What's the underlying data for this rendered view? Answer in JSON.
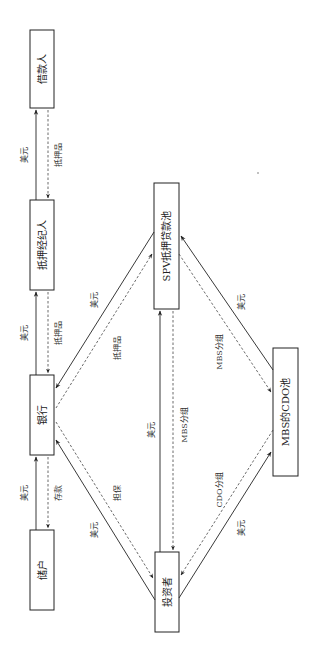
{
  "diagram": {
    "orientation": "rotated-90-ccw",
    "nodes": {
      "borrower": {
        "label": "借款人"
      },
      "broker": {
        "label": "抵押经纪人"
      },
      "bank": {
        "label": "银行"
      },
      "depositor": {
        "label": "储户"
      },
      "spv": {
        "label": "SPV抵押贷款池"
      },
      "cdo": {
        "label": "MBS的CDO池"
      },
      "investor": {
        "label": "投资者"
      }
    },
    "edges": {
      "broker_borrower_usd": {
        "label": "美元",
        "from": "broker",
        "to": "borrower",
        "style": "solid"
      },
      "borrower_broker_collateral": {
        "label": "抵押品",
        "from": "borrower",
        "to": "broker",
        "style": "dashed"
      },
      "bank_broker_usd": {
        "label": "美元",
        "from": "bank",
        "to": "broker",
        "style": "solid"
      },
      "broker_bank_collateral": {
        "label": "抵押品",
        "from": "broker",
        "to": "bank",
        "style": "dashed"
      },
      "depositor_bank_usd": {
        "label": "美元",
        "from": "depositor",
        "to": "bank",
        "style": "solid"
      },
      "bank_depositor_deposit": {
        "label": "存款",
        "from": "bank",
        "to": "depositor",
        "style": "dashed"
      },
      "spv_bank_usd": {
        "label": "美元",
        "from": "spv",
        "to": "bank",
        "style": "solid"
      },
      "bank_spv_collateral": {
        "label": "抵押品",
        "from": "bank",
        "to": "spv",
        "style": "dashed"
      },
      "investor_bank_usd": {
        "label": "美元",
        "from": "investor",
        "to": "bank",
        "style": "solid"
      },
      "bank_investor_guarantee": {
        "label": "担保",
        "from": "bank",
        "to": "investor",
        "style": "dashed"
      },
      "investor_spv_usd": {
        "label": "美元",
        "from": "investor",
        "to": "spv",
        "style": "solid"
      },
      "spv_investor_mbs": {
        "label": "MBS分组",
        "from": "spv",
        "to": "investor",
        "style": "dashed"
      },
      "cdo_spv_usd": {
        "label": "美元",
        "from": "cdo",
        "to": "spv",
        "style": "solid"
      },
      "spv_cdo_mbs": {
        "label": "MBS分组",
        "from": "spv",
        "to": "cdo",
        "style": "dashed"
      },
      "investor_cdo_usd": {
        "label": "美元",
        "from": "investor",
        "to": "cdo",
        "style": "solid"
      },
      "cdo_investor_cdo": {
        "label": "CDO分组",
        "from": "cdo",
        "to": "investor",
        "style": "dashed"
      }
    }
  }
}
